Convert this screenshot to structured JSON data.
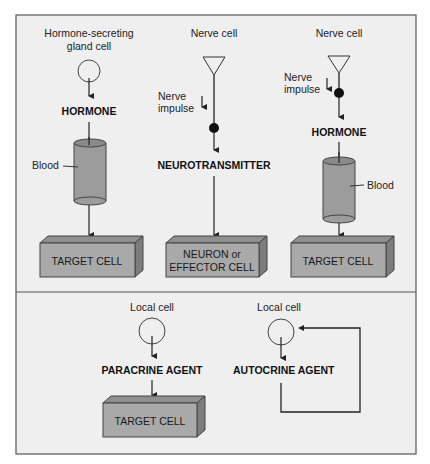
{
  "colors": {
    "panel_bg": "#efefef",
    "frame": "#555555",
    "cell_front": "#a9a9a9",
    "cell_top": "#8f8f8f",
    "cell_side": "#7d7d7d",
    "cylinder": "#9c9c9c",
    "line": "#222222"
  },
  "top_panel": {
    "endocrine": {
      "source_label_line1": "Hormone-secreting",
      "source_label_line2": "gland cell",
      "signal_label": "HORMONE",
      "transport_label": "Blood",
      "target_label": "TARGET CELL"
    },
    "neural": {
      "source_label": "Nerve cell",
      "impulse_line1": "Nerve",
      "impulse_line2": "impulse",
      "signal_label": "NEUROTRANSMITTER",
      "target_line1": "NEURON or",
      "target_line2": "EFFECTOR CELL"
    },
    "neuroendocrine": {
      "source_label": "Nerve cell",
      "impulse_line1": "Nerve",
      "impulse_line2": "impulse",
      "signal_label": "HORMONE",
      "transport_label": "Blood",
      "target_label": "TARGET CELL"
    }
  },
  "bottom_panel": {
    "paracrine": {
      "source_label": "Local cell",
      "signal_label": "PARACRINE AGENT",
      "target_label": "TARGET CELL"
    },
    "autocrine": {
      "source_label": "Local cell",
      "signal_label": "AUTOCRINE AGENT"
    }
  }
}
